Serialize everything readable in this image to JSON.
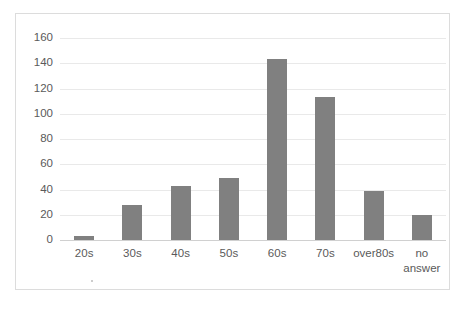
{
  "chart_data": {
    "type": "bar",
    "title": "",
    "subtitle": "",
    "xlabel": "",
    "ylabel": "",
    "categories": [
      "20s",
      "30s",
      "40s",
      "50s",
      "60s",
      "70s",
      "over80s",
      "no\nanswer"
    ],
    "values": [
      3,
      28,
      43,
      49,
      143,
      113,
      39,
      20
    ],
    "series": [
      {
        "name": "",
        "values": [
          3,
          28,
          43,
          49,
          143,
          113,
          39,
          20
        ]
      }
    ],
    "ylim": [
      0,
      160
    ],
    "ytick_step": 20,
    "yticks": [
      "160",
      "140",
      "120",
      "100",
      "80",
      "60",
      "40",
      "20",
      "0"
    ],
    "ytick_values": [
      160,
      140,
      120,
      100,
      80,
      60,
      40,
      20,
      0
    ],
    "grid": true,
    "grid_axis": "y",
    "legend": false,
    "legend_position": "none",
    "annotations": [],
    "colors": {
      "bar": "#808080",
      "gridline": "#e9e9e9",
      "baseline": "#d0d0d0",
      "tick_label": "#5a5a5a",
      "frame_border": "#dcdcdc",
      "plot_background": "#ffffff"
    }
  }
}
